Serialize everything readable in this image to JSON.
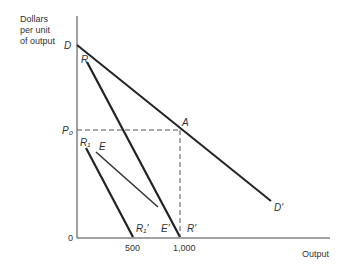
{
  "axes": {
    "y_label_lines": [
      "Dollars",
      "per unit",
      "of output"
    ],
    "x_label": "Output",
    "origin": "0",
    "x_ticks": [
      "500",
      "1,000"
    ],
    "y_ticks": [
      "P₀"
    ]
  },
  "curves": {
    "D": {
      "start": "D",
      "end": "D'"
    },
    "R": {
      "start": "R",
      "end": "R'"
    },
    "R1": {
      "start": "R₁",
      "end": "R₁'"
    },
    "E": {
      "start": "E",
      "end": "E'"
    }
  },
  "points": {
    "A": "A"
  },
  "colors": {
    "line": "#222222",
    "dashed": "#555555",
    "background": "#ffffff"
  }
}
